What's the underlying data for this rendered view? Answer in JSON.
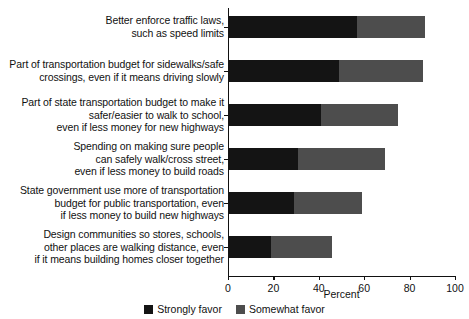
{
  "chart_data": {
    "type": "bar",
    "orientation": "horizontal",
    "stacked": true,
    "title": "",
    "xlabel": "Percent",
    "ylabel": "",
    "xlim": [
      0,
      100
    ],
    "xticks": [
      0,
      20,
      40,
      60,
      80,
      100
    ],
    "grid": false,
    "legend_position": "bottom",
    "categories": [
      "Better enforce traffic laws,\nsuch as speed limits",
      "Part of transportation budget for sidewalks/safe\ncrossings, even if it means driving slowly",
      "Part of state transportation budget to make it\nsafer/easier to walk to school,\neven if less money for new highways",
      "Spending on making sure people\ncan safely walk/cross street,\neven if less money to build roads",
      "State government use more of transportation\nbudget for public transportation, even\nif less money to build new highways",
      "Design communities so stores, schools,\nother places are walking distance, even\nif it means building homes closer together"
    ],
    "series": [
      {
        "name": "Strongly favor",
        "color": "#141414",
        "values": [
          57,
          49,
          41,
          31,
          29,
          19
        ]
      },
      {
        "name": "Somewhat favor",
        "color": "#4d4d4d",
        "values": [
          30,
          37,
          34,
          38,
          30,
          27
        ]
      }
    ],
    "totals": [
      87,
      86,
      75,
      69,
      59,
      46
    ]
  },
  "axis": {
    "x_title": "Percent",
    "tick_labels": [
      "0",
      "20",
      "40",
      "60",
      "80",
      "100"
    ]
  },
  "legend": {
    "items": [
      {
        "label": "Strongly favor",
        "color": "#141414"
      },
      {
        "label": "Somewhat favor",
        "color": "#4d4d4d"
      }
    ]
  }
}
